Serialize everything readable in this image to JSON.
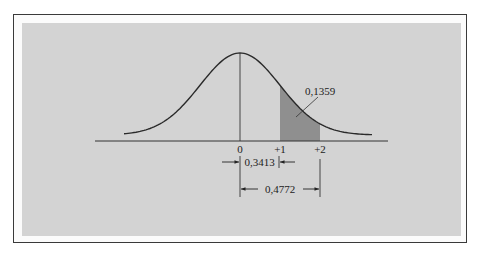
{
  "diagram": {
    "type": "normal-distribution",
    "colors": {
      "frame_border": "#3a3a3a",
      "panel_background": "#d3d3d3",
      "curve": "#2a2a2a",
      "shaded_area": "#8f8f8f",
      "text": "#222222"
    },
    "axis_ticks": [
      {
        "label": "0",
        "z": 0
      },
      {
        "label": "+1",
        "z": 1
      },
      {
        "label": "+2",
        "z": 2
      }
    ],
    "shaded_region": {
      "from_z": 1,
      "to_z": 2,
      "label": "0,1359"
    },
    "dimensions": [
      {
        "from_z": 0,
        "to_z": 1,
        "label": "0,3413",
        "arrow_style": "inward"
      },
      {
        "from_z": 0,
        "to_z": 2,
        "label": "0,4772",
        "arrow_style": "outward"
      }
    ]
  }
}
